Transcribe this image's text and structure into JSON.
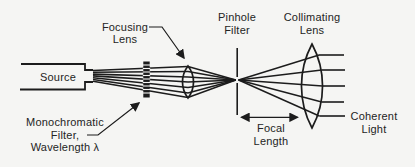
{
  "figure": {
    "type": "optical-schematic",
    "background_color": "#f5f5f3",
    "line_color": "#1c1c1c",
    "text_color": "#242424"
  },
  "labels": {
    "source": "Source",
    "focusing_lens": {
      "line1": "Focusing",
      "line2": "Lens"
    },
    "pinhole_filter": {
      "line1": "Pinhole",
      "line2": "Filter"
    },
    "collimating_lens": {
      "line1": "Collimating",
      "line2": "Lens"
    },
    "monochromatic_filter": {
      "line1": "Monochromatic",
      "line2": "Filter,",
      "line3": "Wavelength λ"
    },
    "focal_length": {
      "line1": "Focal",
      "line2": "Length"
    },
    "coherent_light": {
      "line1": "Coherent",
      "line2": "Light"
    }
  }
}
